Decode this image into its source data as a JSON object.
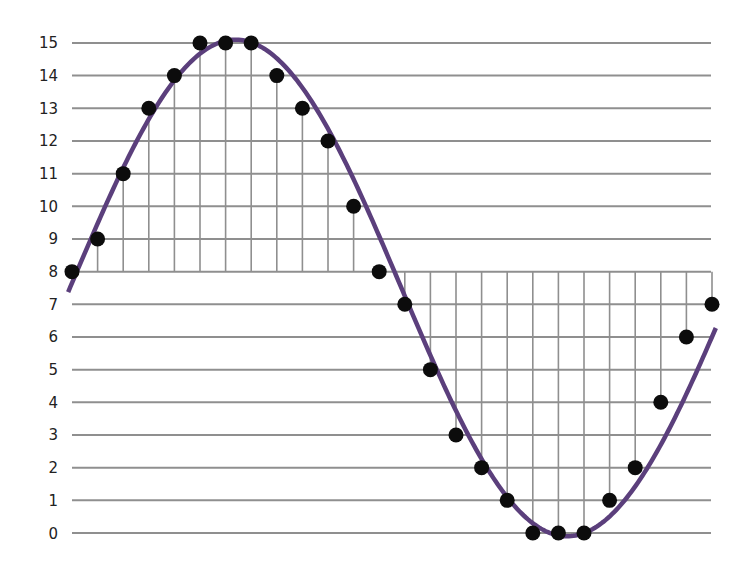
{
  "chart_data": {
    "type": "scatter",
    "title": "",
    "xlabel": "",
    "ylabel": "",
    "y_ticks": [
      0,
      1,
      2,
      3,
      4,
      5,
      6,
      7,
      8,
      9,
      10,
      11,
      12,
      13,
      14,
      15
    ],
    "ylim": [
      0,
      15
    ],
    "x": [
      0,
      1,
      2,
      3,
      4,
      5,
      6,
      7,
      8,
      9,
      10,
      11,
      12,
      13,
      14,
      15,
      16,
      17,
      18,
      19,
      20,
      21,
      22,
      23,
      24,
      25
    ],
    "series": [
      {
        "name": "samples",
        "values": [
          8,
          9,
          11,
          13,
          14,
          15,
          15,
          15,
          14,
          13,
          12,
          10,
          8,
          7,
          5,
          3,
          2,
          1,
          0,
          0,
          0,
          1,
          2,
          4,
          6,
          7
        ]
      },
      {
        "name": "sine curve",
        "style": "line",
        "midline": 7.5,
        "amplitude": 7.6
      }
    ],
    "grid": true,
    "legend": "none",
    "colors": {
      "curve": "#5b3f7c",
      "points": "#0c0c0c",
      "grid": "#8f8f8f",
      "text": "#222222"
    }
  }
}
